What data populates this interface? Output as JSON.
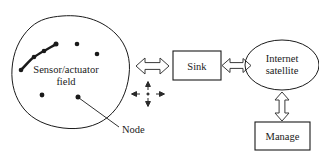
{
  "figure": {
    "type": "network-architecture-diagram",
    "background_color": "#ffffff",
    "stroke_color": "#1a1a1a"
  },
  "field": {
    "label_line1": "Sensor/actuator",
    "label_line2": "field",
    "node_callout": "Node",
    "node_count": 8,
    "nodes": [
      {
        "x": 21,
        "y": 70,
        "in_chain": true
      },
      {
        "x": 34,
        "y": 57,
        "in_chain": true
      },
      {
        "x": 44,
        "y": 51,
        "in_chain": true
      },
      {
        "x": 56,
        "y": 44,
        "in_chain": true
      },
      {
        "x": 77,
        "y": 44,
        "in_chain": false
      },
      {
        "x": 97,
        "y": 54,
        "in_chain": false
      },
      {
        "x": 42,
        "y": 95,
        "in_chain": false
      },
      {
        "x": 78,
        "y": 97,
        "in_chain": false
      }
    ]
  },
  "nodes_boxes": {
    "sink_label": "Sink",
    "satellite_line1": "Internet",
    "satellite_line2": "satellite",
    "manage_label": "Manage"
  },
  "connectors": {
    "field_to_sink": "bidirectional",
    "sink_to_satellite": "bidirectional",
    "satellite_to_manage": "bidirectional",
    "multi_direction_symbol": "four-way-arrows"
  }
}
